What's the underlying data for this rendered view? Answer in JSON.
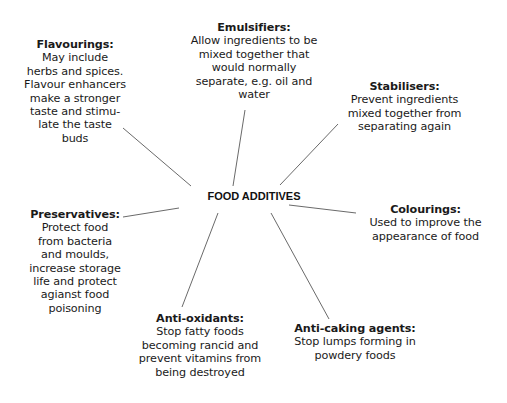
{
  "center": {
    "label": "FOOD ADDITIVES"
  },
  "nodes": [
    {
      "id": "flavourings",
      "title": "Flavourings:",
      "description": "May include\nherbs and spices.\nFlavour enhancers\nmake a stronger\ntaste and stimu-\nlate the taste\nbuds"
    },
    {
      "id": "emulsifiers",
      "title": "Emulsifiers:",
      "description": "Allow ingredients to be\nmixed together that\nwould normally\nseparate, e.g. oil and\nwater"
    },
    {
      "id": "stabilisers",
      "title": "Stabilisers:",
      "description": "Prevent ingredients\nmixed together from\nseparating again"
    },
    {
      "id": "colourings",
      "title": "Colourings:",
      "description": "Used to improve the\nappearance of food"
    },
    {
      "id": "anti-caking-agents",
      "title": "Anti-caking agents:",
      "description": "Stop lumps forming in\npowdery foods"
    },
    {
      "id": "anti-oxidants",
      "title": "Anti-oxidants:",
      "description": "Stop fatty foods\nbecoming rancid and\nprevent vitamins from\nbeing destroyed"
    },
    {
      "id": "preservatives",
      "title": "Preservatives:",
      "description": "Protect food\nfrom bacteria\nand moulds,\nincrease storage\nlife and protect\nagianst food\npoisoning"
    }
  ],
  "colors": {
    "line": "#6a6a6a",
    "text": "#1a1a1a",
    "background": "#ffffff"
  }
}
